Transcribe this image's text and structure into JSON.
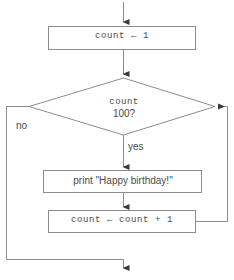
{
  "diagram": {
    "type": "flowchart",
    "colors": {
      "stroke": "#8c8c8c",
      "text": "#4a4a4a",
      "background": "#ffffff",
      "arrowhead": "#3a3a3a"
    },
    "nodes": [
      {
        "id": "init",
        "shape": "rectangle",
        "label": "count ← 1",
        "font": "monospace"
      },
      {
        "id": "decision",
        "shape": "diamond",
        "label_line1": "count",
        "label_line2": "100?",
        "font": "monospace"
      },
      {
        "id": "print",
        "shape": "rectangle",
        "label": "print \"Happy birthday!\"",
        "font": "sans-serif"
      },
      {
        "id": "increment",
        "shape": "rectangle",
        "label": "count ← count + 1",
        "font": "monospace"
      }
    ],
    "edges": [
      {
        "id": "entry",
        "from": "start",
        "to": "init",
        "label": ""
      },
      {
        "id": "init-to-decision",
        "from": "init",
        "to": "decision",
        "label": ""
      },
      {
        "id": "decision-yes",
        "from": "decision",
        "to": "print",
        "label": "yes"
      },
      {
        "id": "decision-no",
        "from": "decision",
        "to": "exit",
        "label": "no"
      },
      {
        "id": "print-to-increment",
        "from": "print",
        "to": "increment",
        "label": ""
      },
      {
        "id": "loop-back",
        "from": "increment",
        "to": "decision",
        "label": ""
      }
    ],
    "labels": {
      "yes": "yes",
      "no": "no"
    }
  }
}
